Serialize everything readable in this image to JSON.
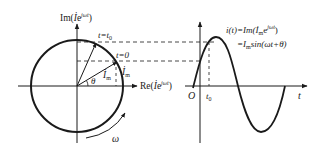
{
  "phasor": {
    "im_axis_label": "Im(",
    "im_axis_label_tail": "e",
    "im_axis_sup": "jωt",
    "im_axis_close": ")",
    "re_axis_label": "Re(",
    "re_axis_label_tail": "e",
    "re_axis_sup": "jωt",
    "re_axis_close": ")",
    "phasor_symbol": "İ",
    "t0_label": "t=t",
    "t0_sub": "0",
    "t_zero_label": "t=0",
    "vector_label": "İ",
    "vector_sub": "m",
    "vector_label_outer": "İ",
    "vector_label_outer_sub": "m",
    "angle_label": "θ",
    "rotation_label": "ω"
  },
  "waveform": {
    "eq_line1_a": "i(t)=Im(",
    "eq_line1_b": "İ",
    "eq_line1_sub": "m",
    "eq_line1_c": "e",
    "eq_line1_sup": "jωt",
    "eq_line1_d": ")",
    "eq_line2_a": "=I",
    "eq_line2_sub": "m",
    "eq_line2_b": "sin(ωt+θ)",
    "origin_label": "O",
    "t0_label": "t",
    "t0_sub": "0",
    "t_axis_label": "t"
  },
  "colors": {
    "line": "#1a1a1a",
    "dash": "#333333"
  }
}
